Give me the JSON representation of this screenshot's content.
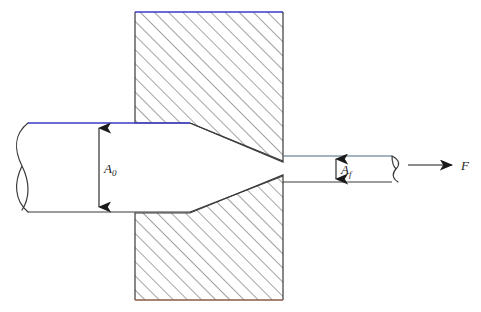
{
  "figure": {
    "background_color": "#ffffff"
  },
  "labels": {
    "initial_area": "A",
    "initial_area_sub": "0",
    "final_area": "A",
    "final_area_sub": "f",
    "force": "F"
  },
  "colors": {
    "outline": "#3a3a38",
    "hatch": "#4a4a48",
    "blue_edge": "#3b3bc8",
    "brown_edge": "#8a5a44",
    "arrow": "#1a1a1a",
    "text": "#1a1a1a"
  },
  "geometry": {
    "upper_die": {
      "points": "135,12 283,12 283,162 190,123 135,123",
      "top_edge": "135,12 283,12"
    },
    "lower_die": {
      "points": "135,213 190,213 283,175 283,300 135,300",
      "bottom_edge": "135,300 283,300"
    },
    "workpiece_entry": {
      "top_y": 123,
      "bottom_y": 212,
      "left_x": 28,
      "die_contact_x": 190
    },
    "workpiece_exit": {
      "top_y": 156,
      "bottom_y": 182,
      "right_x": 398
    },
    "dimension_A0": {
      "x": 99,
      "y_top": 124,
      "y_bottom": 211
    },
    "dimension_Af": {
      "x": 336,
      "y_top": 156,
      "y_bottom": 182
    },
    "force_arrow": {
      "x_start": 408,
      "x_end": 455,
      "y": 165
    }
  }
}
